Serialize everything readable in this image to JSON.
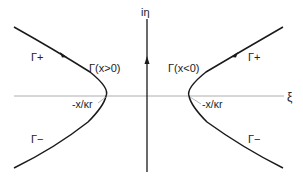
{
  "diagram": {
    "axes": {
      "horizontal_label": "ξ",
      "vertical_label": "iη"
    },
    "contours": {
      "left": {
        "name": "Γ(x>0)",
        "upper_branch": "Γ+",
        "lower_branch": "Γ−",
        "vertex_label": "-x/κr"
      },
      "right": {
        "name": "Γ(x<0)",
        "upper_branch": "Γ+",
        "lower_branch": "Γ−",
        "vertex_label": "-x/κr"
      }
    },
    "colors": {
      "curve": "#1a1a1a",
      "axis_h": "#9a9a9a",
      "axis_v": "#1a1a1a",
      "leader": "#9a9a9a"
    }
  }
}
